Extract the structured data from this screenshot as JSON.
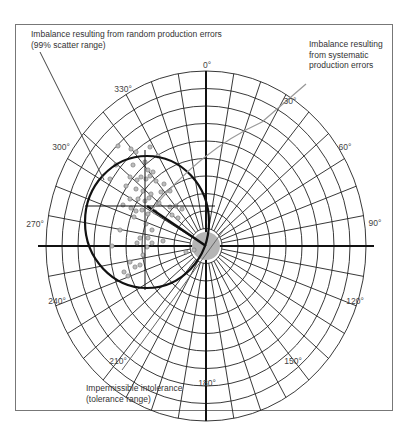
{
  "figure": {
    "annotations": {
      "random_errors": {
        "line1": "Imbalance resulting from random production errors",
        "line2": "(99% scatter range)"
      },
      "systematic_errors": {
        "line1": "Imbalance resulting",
        "line2": "from systematic",
        "line3": "production errors"
      },
      "tolerance": {
        "line1": "Impermissible intolerance",
        "line2": "(tolerance range)"
      }
    },
    "angle_labels": {
      "a0": "0°",
      "a30": "30°",
      "a60": "60°",
      "a90": "90°",
      "a120": "120°",
      "a150": "150°",
      "a180": "180°",
      "a210": "210°",
      "a240": "240°",
      "a270": "270°",
      "a300": "300°",
      "a330": "330°"
    },
    "colors": {
      "grid": "#222222",
      "scatter_circle": "#111111",
      "tolerance_hub": "#b5b5b5",
      "points": "#9a9a9a",
      "leader_gray": "#888888",
      "frame": "#777777"
    }
  }
}
